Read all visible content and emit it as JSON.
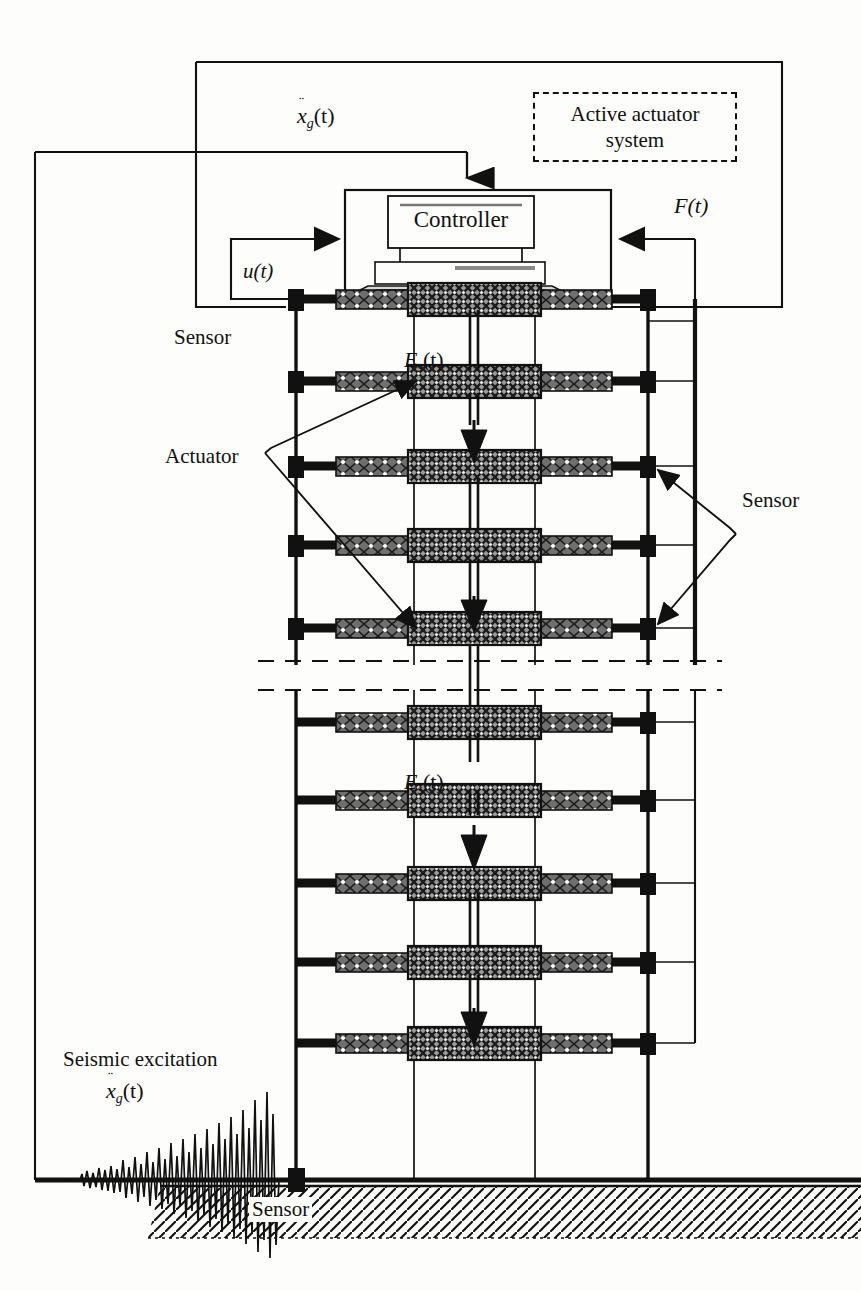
{
  "figure": {
    "domain": "diagram",
    "kind": "structural-control-schematic"
  },
  "labels": {
    "active_actuator_system_line1": "Active actuator",
    "active_actuator_system_line2": "system",
    "controller": "Controller",
    "sensor_left": "Sensor",
    "sensor_right": "Sensor",
    "sensor_ground": "Sensor",
    "actuator": "Actuator",
    "seismic_excitation": "Seismic excitation"
  },
  "signals": {
    "ground_acceleration_symbol": "x",
    "ground_acceleration_sub": "g",
    "ground_acceleration_args": "(t)",
    "ground_acceleration_dots": "¨",
    "control_force_u": "u(t)",
    "control_force_F": "F(t)",
    "story_force_symbol": "E",
    "story_force_sub": "s",
    "story_force_args": "(t)"
  },
  "colors": {
    "ink": "#111111",
    "paper": "#fdfdfc",
    "actuator_fill": "#8f8f8f",
    "beam_dark": "#1a1a1a",
    "hatch": "#111111"
  },
  "structure": {
    "storeys_upper": 5,
    "storeys_lower": 5,
    "columns_x": [
      296,
      414,
      535,
      648
    ],
    "upper_floor_y": [
      299,
      381,
      466,
      545,
      628
    ],
    "lower_floor_y": [
      722,
      800,
      883,
      962,
      1043
    ],
    "break_y": [
      661,
      690
    ],
    "ground_y": 1180,
    "sensor_nodes_left_x": 296,
    "sensor_nodes_right_x": 648
  }
}
